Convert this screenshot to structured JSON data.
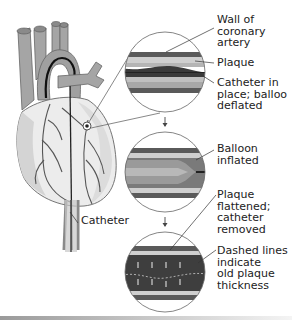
{
  "figure": {
    "labels": {
      "wall": "Wall of\ncoronary\nartery",
      "plaque": "Plaque",
      "catheter_in_place": "Catheter in\nplace; balloo\ndeflated",
      "balloon_inflated": "Balloon\ninflated",
      "plaque_flattened": "Plaque\nflattened;\ncatheter\nremoved",
      "dashed_lines": "Dashed lines\nindicate\nold plaque\nthickness",
      "catheter": "Catheter"
    },
    "panels": [
      {
        "id": "panel-1",
        "state": "catheter in place, balloon deflated"
      },
      {
        "id": "panel-2",
        "state": "balloon inflated"
      },
      {
        "id": "panel-3",
        "state": "plaque flattened, catheter removed"
      }
    ],
    "colors": {
      "heart_fill": "#e6e6e6",
      "vessel_fill": "#9c9c9c",
      "artery_dark": "#4a4a4a",
      "plaque": "#c9c9c9",
      "outline": "#555555"
    }
  }
}
